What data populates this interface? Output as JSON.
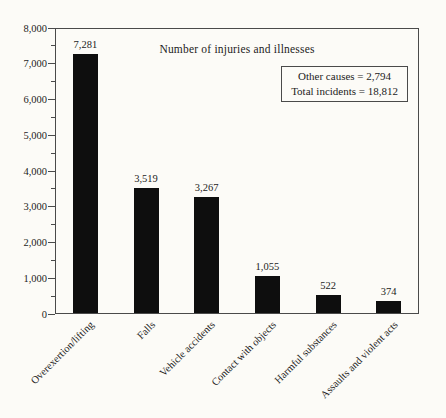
{
  "chart_data": {
    "type": "bar",
    "title": "Number of injuries and illnesses",
    "categories": [
      "Overexertion/lifting",
      "Falls",
      "Vehicle accidents",
      "Contact with objects",
      "Harmful substances",
      "Assaults and violent acts"
    ],
    "values": [
      7281,
      3519,
      3267,
      1055,
      522,
      374
    ],
    "bar_labels": [
      "7,281",
      "3,519",
      "3,267",
      "1,055",
      "522",
      "374"
    ],
    "xlabel": "",
    "ylabel": "",
    "ylim": [
      0,
      8000
    ],
    "ytick_interval": 1000,
    "minor_tick_interval": 500,
    "ytick_labels": [
      "0",
      "1,000",
      "2,000",
      "3,000",
      "4,000",
      "5,000",
      "6,000",
      "7,000",
      "8,000"
    ],
    "grid": false,
    "legend_position": "none",
    "annotation_box": {
      "lines": [
        "Other causes = 2,794",
        "Total incidents = 18,812"
      ]
    },
    "bar_color": "#0e0e0e",
    "axis_color": "#4a4a4a",
    "text_color": "#1c1c1c",
    "background_color": "#fcfbf7"
  }
}
